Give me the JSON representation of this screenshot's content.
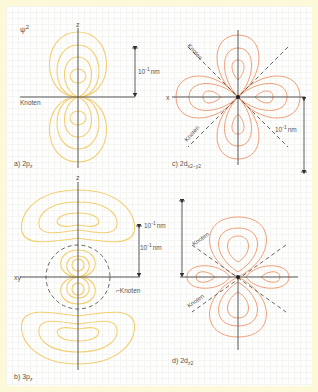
{
  "colors": {
    "background_border": "#fdf9d8",
    "p_orbital": "#f2cf72",
    "d_orbital": "#ef9f78",
    "axis": "#555555",
    "node_dash": "#555555",
    "label": "#555555"
  },
  "panels": [
    {
      "id": "a",
      "caption_prefix": "a) 2p",
      "caption_sub": "z",
      "title": "ψ",
      "title_sup": "2",
      "axis_label_vertical": "z",
      "node_label": "Knoten",
      "scale_label": "10",
      "scale_sup": "-1",
      "scale_unit": "nm"
    },
    {
      "id": "b",
      "caption_prefix": "b) 3p",
      "caption_sub": "z",
      "axis_label_vertical": "z",
      "axis_label_horizontal": "xy",
      "node_label": "Knoten",
      "scale_label": "10",
      "scale_sup": "-1",
      "scale_unit": "nm"
    },
    {
      "id": "c",
      "caption_prefix": "c) 2d",
      "caption_sub": "x2−y2",
      "axis_label_horizontal": "x",
      "node_label_1": "Knoten",
      "node_label_2": "Knoten",
      "scale_label": "10",
      "scale_sup": "-1",
      "scale_unit": "nm"
    },
    {
      "id": "d",
      "caption_prefix": "d) 2d",
      "caption_sub": "z2",
      "node_label_1": "Knoten",
      "node_label_2": "Knoten",
      "scale_label": "10",
      "scale_sup": "-1",
      "scale_unit": "nm"
    }
  ]
}
